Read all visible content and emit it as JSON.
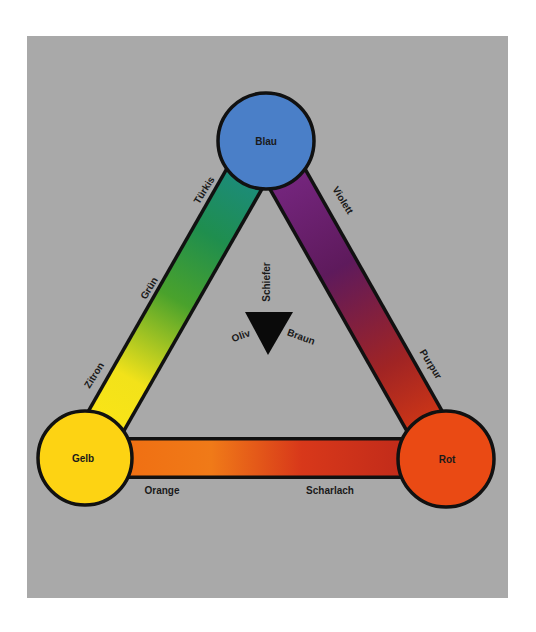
{
  "diagram": {
    "title": "",
    "background_color": "#a9a9a9",
    "primaries": {
      "top": {
        "label": "Blau",
        "color": "#4a7fc8"
      },
      "left": {
        "label": "Gelb",
        "color": "#fdd313"
      },
      "right": {
        "label": "Rot",
        "color": "#ea4a14"
      }
    },
    "edges": {
      "left_side": {
        "from": "Gelb",
        "to": "Blau",
        "labels": [
          "Zitron",
          "Grün",
          "Türkis"
        ],
        "gradient": [
          "#ffe614",
          "#e8e21e",
          "#3fa42e",
          "#1a8f5a",
          "#1e8a92"
        ]
      },
      "right_side": {
        "from": "Blau",
        "to": "Rot",
        "labels": [
          "Violett",
          "Purpur"
        ],
        "gradient": [
          "#7a2a8a",
          "#6a1f5a",
          "#a52a2a",
          "#e04010"
        ]
      },
      "bottom_side": {
        "from": "Gelb",
        "to": "Rot",
        "labels": [
          "Orange",
          "Scharlach"
        ],
        "gradient": [
          "#f06a10",
          "#f0781a",
          "#e0401a",
          "#b8281a",
          "#c02818"
        ]
      }
    },
    "center": {
      "glyph": "black-down-triangle",
      "labels": {
        "top": "Schiefer",
        "left": "Oliv",
        "right": "Braun"
      }
    }
  }
}
